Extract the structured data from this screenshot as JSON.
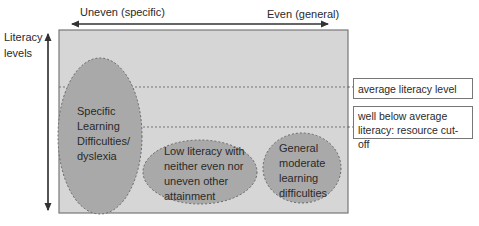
{
  "diagram": {
    "horizontal_axis": {
      "left_label": "Uneven (specific)",
      "right_label": "Even (general)"
    },
    "vertical_axis": {
      "label_line1": "Literacy",
      "label_line2": "levels"
    },
    "thresholds": [
      {
        "label": "average literacy level"
      },
      {
        "label_line1": "well below average",
        "label_line2": "literacy: resource cut-off"
      }
    ],
    "groups": [
      {
        "lines": [
          "Specific",
          "Learning",
          "Difficulties/",
          "dyslexia"
        ]
      },
      {
        "lines": [
          "Low literacy with",
          "neither even nor",
          "uneven other",
          "attainment"
        ]
      },
      {
        "lines": [
          "General",
          "moderate",
          "learning",
          "difficulties"
        ]
      }
    ],
    "colors": {
      "panel_fill": "#d6d6d6",
      "panel_border": "#777777",
      "ellipse_fill": "#a9a9a9",
      "ellipse_border": "#666666",
      "arrow": "#333333"
    }
  }
}
